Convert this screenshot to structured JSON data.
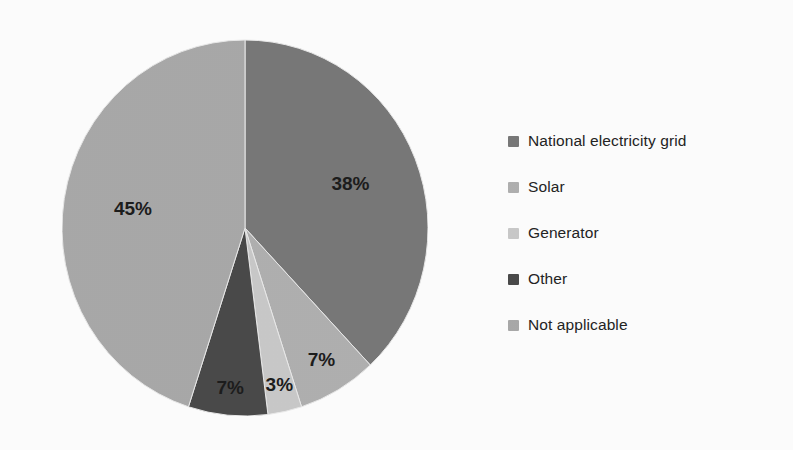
{
  "chart_data": {
    "type": "pie",
    "title": "",
    "subtitle": "",
    "xlabel": "",
    "ylabel": "",
    "legend_position": "right",
    "grid": false,
    "start_angle_deg": 0,
    "direction": "clockwise",
    "categories": [
      "National electricity grid",
      "Solar",
      "Generator",
      "Other",
      "Not applicable"
    ],
    "values": [
      38,
      7,
      3,
      7,
      45
    ],
    "value_unit": "%",
    "data_labels": [
      "38%",
      "7%",
      "3%",
      "7%",
      "45%"
    ],
    "colors": [
      "#787878",
      "#b0b0b0",
      "#c9c9c9",
      "#4a4a4a",
      "#a9a9a9"
    ],
    "slices": [
      {
        "label": "National electricity grid",
        "value": 38,
        "data_label": "38%",
        "color": "#787878"
      },
      {
        "label": "Solar",
        "value": 7,
        "data_label": "7%",
        "color": "#b0b0b0"
      },
      {
        "label": "Generator",
        "value": 3,
        "data_label": "3%",
        "color": "#c9c9c9"
      },
      {
        "label": "Other",
        "value": 7,
        "data_label": "7%",
        "color": "#4a4a4a"
      },
      {
        "label": "Not applicable",
        "value": 45,
        "data_label": "45%",
        "color": "#a9a9a9"
      }
    ]
  },
  "legend": {
    "items": [
      {
        "label": "National electricity grid",
        "color": "#787878"
      },
      {
        "label": "Solar",
        "color": "#b0b0b0"
      },
      {
        "label": "Generator",
        "color": "#c9c9c9"
      },
      {
        "label": "Other",
        "color": "#4a4a4a"
      },
      {
        "label": "Not applicable",
        "color": "#a9a9a9"
      }
    ]
  },
  "labels": {
    "national_electricity_grid_pct": "38%",
    "solar_pct": "7%",
    "generator_pct": "3%",
    "other_pct": "7%",
    "not_applicable_pct": "45%"
  }
}
